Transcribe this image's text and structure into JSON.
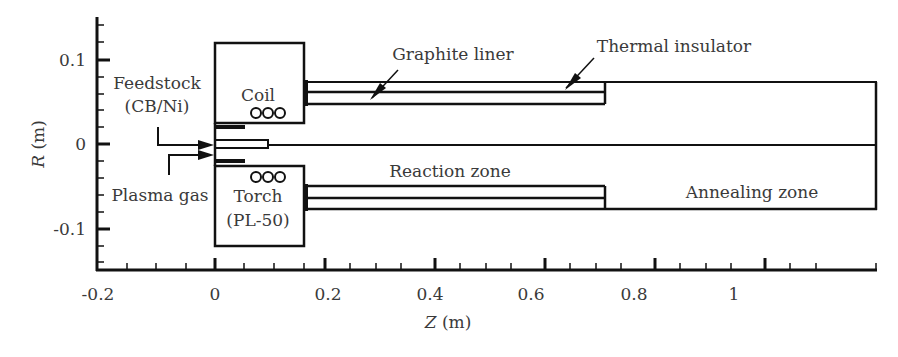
{
  "figure": {
    "type": "schematic",
    "x_axis": {
      "label_var": "Z",
      "label_unit": " (m)",
      "ticks": [
        "-0.2",
        "0",
        "0.2",
        "0.4",
        "0.6",
        "0.8",
        "1"
      ]
    },
    "y_axis": {
      "label_var": "R",
      "label_unit": " (m)",
      "ticks": [
        "0.1",
        "0",
        "-0.1"
      ]
    },
    "labels": {
      "feedstock_line1": "Feedstock",
      "feedstock_line2": "(CB/Ni)",
      "plasma_gas": "Plasma gas",
      "coil": "Coil",
      "coil_turns": "ooo",
      "torch_line1": "Torch",
      "torch_line2": "(PL-50)",
      "graphite_liner": "Graphite liner",
      "thermal_insulator": "Thermal insulator",
      "reaction_zone": "Reaction zone",
      "annealing_zone": "Annealing zone"
    },
    "colors": {
      "line": "#111111",
      "text": "#3a3a3a"
    }
  }
}
